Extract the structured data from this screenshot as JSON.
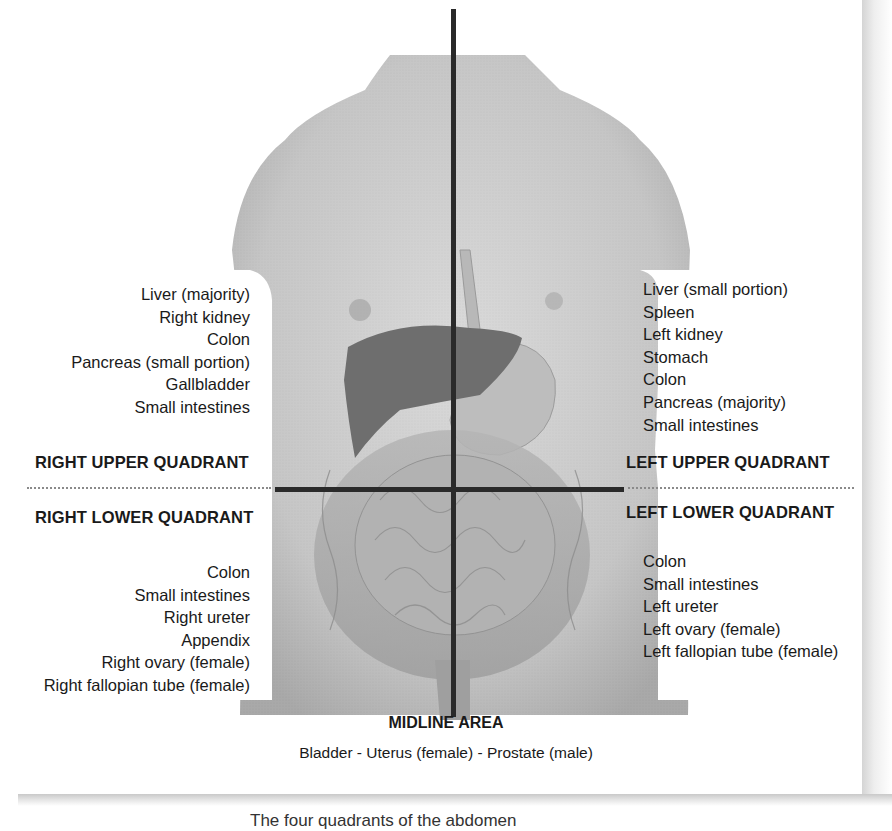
{
  "figure": {
    "quadrants": {
      "right_upper": {
        "title": "RIGHT UPPER QUADRANT",
        "organs": [
          "Liver (majority)",
          "Right kidney",
          "Colon",
          "Pancreas (small portion)",
          "Gallbladder",
          "Small intestines"
        ]
      },
      "left_upper": {
        "title": "LEFT UPPER QUADRANT",
        "organs": [
          "Liver (small portion)",
          "Spleen",
          "Left kidney",
          "Stomach",
          "Colon",
          "Pancreas (majority)",
          "Small intestines"
        ]
      },
      "right_lower": {
        "title": "RIGHT LOWER QUADRANT",
        "organs": [
          "Colon",
          "Small intestines",
          "Right ureter",
          "Appendix",
          "Right ovary (female)",
          "Right fallopian tube (female)"
        ]
      },
      "left_lower": {
        "title": "LEFT LOWER QUADRANT",
        "organs": [
          "Colon",
          "Small intestines",
          "Left ureter",
          "Left ovary (female)",
          "Left fallopian tube (female)"
        ]
      }
    },
    "midline": {
      "title": "MIDLINE AREA",
      "description": "Bladder - Uterus (female) - Prostate (male)"
    },
    "caption_partial": "The four quadrants of the abdomen",
    "colors": {
      "skin": "#c9c9c9",
      "liver": "#6e6e6e",
      "axis_lines": "#2a2a2a",
      "text": "#1a1a1a"
    }
  }
}
